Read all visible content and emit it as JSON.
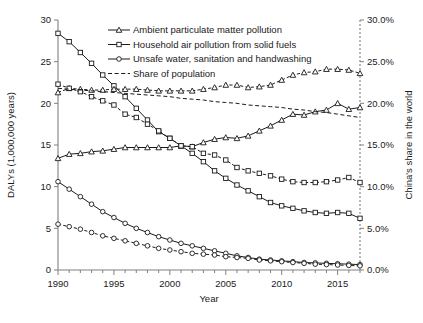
{
  "chart_data": {
    "type": "line",
    "title": "",
    "xlabel": "Year",
    "ylabel": "DALYs (1,000,000 years)",
    "y2label": "China's share in the world",
    "xlim": [
      1990,
      2017
    ],
    "ylim": [
      0,
      30
    ],
    "y2lim": [
      0.0,
      30.0
    ],
    "grid": false,
    "legend_position": "top-center",
    "x_tick_labels": [
      "1990",
      "1995",
      "2000",
      "2005",
      "2010",
      "2015"
    ],
    "x_tick_values": [
      1990,
      1995,
      2000,
      2005,
      2010,
      2015
    ],
    "x_minor_ticks_every": 1,
    "y_tick_labels": [
      "0",
      "5",
      "10",
      "15",
      "20",
      "25",
      "30"
    ],
    "y_tick_values": [
      0,
      5,
      10,
      15,
      20,
      25,
      30
    ],
    "y2_tick_labels": [
      "0.0%",
      "5.0%",
      "10.0%",
      "15.0%",
      "20.0%",
      "25.0%",
      "30.0%"
    ],
    "y2_tick_values": [
      0,
      5,
      10,
      15,
      20,
      25,
      30
    ],
    "x": [
      1990,
      1991,
      1992,
      1993,
      1994,
      1995,
      1996,
      1997,
      1998,
      1999,
      2000,
      2001,
      2002,
      2003,
      2004,
      2005,
      2006,
      2007,
      2008,
      2009,
      2010,
      2011,
      2012,
      2013,
      2014,
      2015,
      2016,
      2017
    ],
    "series": [
      {
        "name": "Ambient particulate matter pollution",
        "axis": "left",
        "marker": "triangle",
        "style": "solid",
        "values": [
          13.4,
          13.9,
          14.0,
          14.2,
          14.3,
          14.5,
          14.7,
          14.7,
          14.7,
          14.7,
          14.7,
          14.9,
          14.8,
          15.3,
          15.7,
          15.9,
          15.8,
          16.1,
          16.7,
          17.3,
          18.0,
          18.7,
          18.6,
          19.0,
          19.2,
          20.0,
          19.3,
          19.5
        ]
      },
      {
        "name": "Household air pollution from solid fuels",
        "axis": "left",
        "marker": "square",
        "style": "solid",
        "values": [
          28.4,
          27.4,
          26.1,
          24.8,
          23.4,
          22.1,
          20.8,
          19.4,
          18.0,
          16.6,
          15.8,
          14.9,
          14.0,
          13.0,
          11.9,
          11.0,
          10.2,
          9.5,
          8.8,
          8.1,
          7.7,
          7.4,
          7.1,
          6.9,
          6.8,
          6.9,
          6.8,
          6.2
        ]
      },
      {
        "name": "Unsafe water, sanitation and handwashing",
        "axis": "left",
        "marker": "circle",
        "style": "solid",
        "values": [
          10.6,
          9.7,
          8.8,
          7.9,
          7.0,
          6.3,
          5.6,
          5.0,
          4.5,
          4.0,
          3.6,
          3.2,
          2.9,
          2.6,
          2.3,
          2.0,
          1.7,
          1.5,
          1.3,
          1.2,
          1.1,
          1.0,
          0.9,
          0.85,
          0.8,
          0.75,
          0.7,
          0.65
        ]
      },
      {
        "name": "Ambient particulate matter pollution",
        "axis": "right",
        "marker": "triangle",
        "style": "dashed",
        "values": [
          21.3,
          21.8,
          21.7,
          21.6,
          21.6,
          21.7,
          21.7,
          21.7,
          21.6,
          21.5,
          21.5,
          21.5,
          21.5,
          21.7,
          21.9,
          22.2,
          22.2,
          21.9,
          22.0,
          22.2,
          22.8,
          23.4,
          23.7,
          23.8,
          24.1,
          24.1,
          24.0,
          23.6
        ]
      },
      {
        "name": "Household air pollution from solid fuels",
        "axis": "right",
        "marker": "square",
        "style": "dashed",
        "values": [
          22.3,
          21.8,
          21.4,
          20.8,
          20.3,
          19.8,
          18.7,
          18.3,
          17.5,
          16.7,
          15.8,
          14.9,
          14.8,
          14.0,
          13.8,
          13.2,
          12.3,
          11.9,
          11.6,
          11.3,
          10.9,
          10.6,
          10.5,
          10.5,
          10.6,
          10.8,
          11.1,
          10.5
        ]
      },
      {
        "name": "Unsafe water, sanitation and handwashing",
        "axis": "right",
        "marker": "circle",
        "style": "dashed",
        "values": [
          5.5,
          5.2,
          4.9,
          4.5,
          4.1,
          3.8,
          3.5,
          3.2,
          2.9,
          2.6,
          2.4,
          2.2,
          2.0,
          1.9,
          1.8,
          1.6,
          1.5,
          1.4,
          1.2,
          1.1,
          1.0,
          0.9,
          0.8,
          0.7,
          0.65,
          0.6,
          0.55,
          0.5
        ]
      },
      {
        "name": "Share of population",
        "axis": "right",
        "marker": "none",
        "style": "dashed",
        "values": [
          21.8,
          21.7,
          21.6,
          21.5,
          21.4,
          21.3,
          21.2,
          21.1,
          21.0,
          20.9,
          20.8,
          20.6,
          20.5,
          20.4,
          20.2,
          20.1,
          20.0,
          19.8,
          19.7,
          19.6,
          19.5,
          19.3,
          19.2,
          19.0,
          18.9,
          18.7,
          18.5,
          18.3
        ]
      }
    ],
    "legend": [
      {
        "label": "Ambient particulate matter pollution",
        "marker": "triangle",
        "style": "solid"
      },
      {
        "label": "Household air pollution from solid fuels",
        "marker": "square",
        "style": "solid"
      },
      {
        "label": "Unsafe water, sanitation and handwashing",
        "marker": "circle",
        "style": "solid"
      },
      {
        "label": "Share of population",
        "marker": "none",
        "style": "dashed"
      }
    ]
  }
}
